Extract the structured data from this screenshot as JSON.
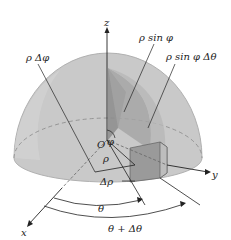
{
  "diagram": {
    "labels": {
      "z_axis": "z",
      "y_axis": "y",
      "x_axis": "x",
      "origin": "O",
      "phi": "φ",
      "rho": "ρ",
      "delta_rho": "Δρ",
      "rho_delta_phi": "ρ Δφ",
      "rho_sin_phi": "ρ sin φ",
      "rho_sin_phi_delta_theta": "ρ sin φ Δθ",
      "theta": "θ",
      "theta_plus_delta_theta": "θ + Δθ"
    },
    "colors": {
      "hemisphere_fill": "#c8c8c8",
      "hemisphere_rim": "#b4b4b4",
      "wedge_dark": "#8a8a8a",
      "wedge_mid": "#a6a6a6",
      "box_fill": "#9c9c9c",
      "line": "#222222"
    }
  }
}
